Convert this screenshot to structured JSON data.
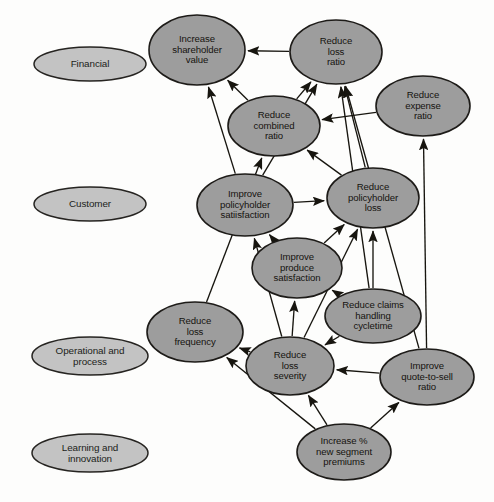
{
  "diagram": {
    "type": "strategy-map",
    "style": {
      "objective_fill": "#9d9d9d",
      "objective_stroke": "#1d1b18",
      "perspective_fill": "#c3c3c3",
      "perspective_stroke": "#262421",
      "arrow_color": "#17150f",
      "background": "#fdfdfc"
    },
    "perspectives": [
      {
        "id": "financial",
        "label": "Financial",
        "cx": 90,
        "cy": 64,
        "rx": 56,
        "ry": 17
      },
      {
        "id": "customer",
        "label": "Customer",
        "cx": 90,
        "cy": 204,
        "rx": 56,
        "ry": 17
      },
      {
        "id": "operational",
        "label": "Operational and\nprocess",
        "cx": 90,
        "cy": 356,
        "rx": 58,
        "ry": 19
      },
      {
        "id": "learning",
        "label": "Learning and\ninnovation",
        "cx": 90,
        "cy": 453,
        "rx": 58,
        "ry": 19
      }
    ],
    "objectives": [
      {
        "id": "shareholder_value",
        "label": "Increase\nshareholder\nvalue",
        "cx": 197,
        "cy": 50,
        "rx": 48,
        "ry": 35,
        "perspective": "financial"
      },
      {
        "id": "loss_ratio",
        "label": "Reduce\nloss\nratio",
        "cx": 336,
        "cy": 52,
        "rx": 46,
        "ry": 32,
        "perspective": "financial"
      },
      {
        "id": "expense_ratio",
        "label": "Reduce\nexpense\nratio",
        "cx": 423,
        "cy": 106,
        "rx": 47,
        "ry": 30,
        "perspective": "financial"
      },
      {
        "id": "combined_ratio",
        "label": "Reduce\ncombined\nratio",
        "cx": 274,
        "cy": 126,
        "rx": 46,
        "ry": 30,
        "perspective": "financial"
      },
      {
        "id": "policyholder_satis",
        "label": "Improve\npolicyholder\nsatiisfaction",
        "cx": 245,
        "cy": 205,
        "rx": 48,
        "ry": 31,
        "perspective": "customer"
      },
      {
        "id": "policyholder_loss",
        "label": "Reduce\npolicyholder\nloss",
        "cx": 373,
        "cy": 198,
        "rx": 46,
        "ry": 30,
        "perspective": "customer"
      },
      {
        "id": "produce_satis",
        "label": "Improve\nproduce\nsatisfaction",
        "cx": 297,
        "cy": 268,
        "rx": 45,
        "ry": 30,
        "perspective": "customer"
      },
      {
        "id": "claims_cycletime",
        "label": "Reduce claims\nhandling\ncycletime",
        "cx": 373,
        "cy": 316,
        "rx": 48,
        "ry": 27,
        "perspective": "operational"
      },
      {
        "id": "loss_frequency",
        "label": "Reduce\nloss\nfrequency",
        "cx": 195,
        "cy": 332,
        "rx": 48,
        "ry": 30,
        "perspective": "operational"
      },
      {
        "id": "loss_severity",
        "label": "Reduce\nloss\nseverity",
        "cx": 290,
        "cy": 366,
        "rx": 44,
        "ry": 29,
        "perspective": "operational"
      },
      {
        "id": "quote_to_sell",
        "label": "Improve\nquote-to-sell\nratio",
        "cx": 427,
        "cy": 377,
        "rx": 47,
        "ry": 28,
        "perspective": "operational"
      },
      {
        "id": "new_segment",
        "label": "Increase %\nnew segment\npremiums",
        "cx": 344,
        "cy": 452,
        "rx": 47,
        "ry": 28,
        "perspective": "learning"
      }
    ],
    "edges": [
      {
        "from": "policyholder_satis",
        "to": "shareholder_value"
      },
      {
        "from": "combined_ratio",
        "to": "shareholder_value"
      },
      {
        "from": "loss_ratio",
        "to": "shareholder_value"
      },
      {
        "from": "combined_ratio",
        "to": "loss_ratio"
      },
      {
        "from": "policyholder_satis",
        "to": "loss_ratio"
      },
      {
        "from": "policyholder_loss",
        "to": "loss_ratio"
      },
      {
        "from": "claims_cycletime",
        "to": "loss_ratio"
      },
      {
        "from": "quote_to_sell",
        "to": "loss_ratio"
      },
      {
        "from": "expense_ratio",
        "to": "combined_ratio"
      },
      {
        "from": "policyholder_loss",
        "to": "combined_ratio"
      },
      {
        "from": "quote_to_sell",
        "to": "expense_ratio"
      },
      {
        "from": "policyholder_satis",
        "to": "policyholder_loss"
      },
      {
        "from": "produce_satis",
        "to": "policyholder_loss"
      },
      {
        "from": "claims_cycletime",
        "to": "policyholder_loss"
      },
      {
        "from": "loss_severity",
        "to": "policyholder_loss"
      },
      {
        "from": "produce_satis",
        "to": "policyholder_satis"
      },
      {
        "from": "loss_severity",
        "to": "policyholder_satis"
      },
      {
        "from": "loss_frequency",
        "to": "combined_ratio"
      },
      {
        "from": "claims_cycletime",
        "to": "produce_satis"
      },
      {
        "from": "loss_severity",
        "to": "produce_satis"
      },
      {
        "from": "claims_cycletime",
        "to": "loss_severity"
      },
      {
        "from": "quote_to_sell",
        "to": "loss_severity"
      },
      {
        "from": "loss_severity",
        "to": "loss_frequency"
      },
      {
        "from": "new_segment",
        "to": "loss_frequency"
      },
      {
        "from": "new_segment",
        "to": "loss_severity"
      },
      {
        "from": "new_segment",
        "to": "quote_to_sell"
      }
    ]
  }
}
